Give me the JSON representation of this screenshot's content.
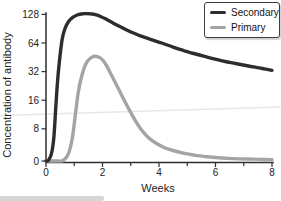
{
  "chart_data": {
    "type": "line",
    "title": "",
    "xlabel": "Weeks",
    "ylabel": "Concentration of antibody",
    "x_range": [
      0,
      8
    ],
    "x_ticks": [
      0,
      2,
      4,
      6,
      8
    ],
    "x_minor_ticks": [
      1,
      3,
      5,
      7
    ],
    "y_ticks": [
      0,
      8,
      16,
      32,
      64,
      128
    ],
    "y_scale": "log2 (0 pinned at baseline)",
    "grid": "off",
    "legend_position": "top-right",
    "series": [
      {
        "name": "Secondary",
        "color": "#2d2d2d",
        "points": [
          [
            0,
            0
          ],
          [
            0.05,
            0
          ],
          [
            0.1,
            0.3
          ],
          [
            0.2,
            2
          ],
          [
            0.28,
            6
          ],
          [
            0.35,
            14
          ],
          [
            0.42,
            28
          ],
          [
            0.5,
            48
          ],
          [
            0.58,
            72
          ],
          [
            0.68,
            92
          ],
          [
            0.8,
            108
          ],
          [
            0.95,
            119
          ],
          [
            1.1,
            126
          ],
          [
            1.3,
            130
          ],
          [
            1.55,
            130
          ],
          [
            1.75,
            127
          ],
          [
            1.95,
            121
          ],
          [
            2.15,
            113
          ],
          [
            2.4,
            103
          ],
          [
            2.65,
            94
          ],
          [
            2.95,
            85
          ],
          [
            3.3,
            77
          ],
          [
            3.7,
            70
          ],
          [
            4.1,
            64
          ],
          [
            4.5,
            58
          ],
          [
            4.9,
            53
          ],
          [
            5.3,
            49
          ],
          [
            5.7,
            45.5
          ],
          [
            6.1,
            42.5
          ],
          [
            6.5,
            40
          ],
          [
            6.9,
            38
          ],
          [
            7.3,
            36
          ],
          [
            7.65,
            34.5
          ],
          [
            8,
            33
          ]
        ]
      },
      {
        "name": "Primary",
        "color": "#a4a4a4",
        "points": [
          [
            0,
            0
          ],
          [
            0.3,
            0
          ],
          [
            0.55,
            0
          ],
          [
            0.65,
            0.4
          ],
          [
            0.75,
            1.2
          ],
          [
            0.85,
            3
          ],
          [
            0.95,
            6.5
          ],
          [
            1.05,
            12
          ],
          [
            1.15,
            20
          ],
          [
            1.28,
            30
          ],
          [
            1.42,
            39
          ],
          [
            1.58,
            44.5
          ],
          [
            1.75,
            46.5
          ],
          [
            1.95,
            44
          ],
          [
            2.12,
            38
          ],
          [
            2.3,
            30
          ],
          [
            2.5,
            23
          ],
          [
            2.7,
            17.5
          ],
          [
            2.9,
            13.5
          ],
          [
            3.1,
            10.5
          ],
          [
            3.35,
            8
          ],
          [
            3.6,
            6
          ],
          [
            3.9,
            4.4
          ],
          [
            4.2,
            3.3
          ],
          [
            4.5,
            2.6
          ],
          [
            4.9,
            1.9
          ],
          [
            5.3,
            1.4
          ],
          [
            5.7,
            1.05
          ],
          [
            6.1,
            0.8
          ],
          [
            6.6,
            0.6
          ],
          [
            7.1,
            0.5
          ],
          [
            7.6,
            0.4
          ],
          [
            8,
            0.35
          ]
        ]
      }
    ]
  },
  "artifacts": {
    "scan_line_color": "#e7e7e7",
    "strip_color": "#d6d6d6"
  }
}
